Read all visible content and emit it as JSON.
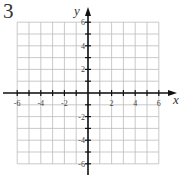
{
  "problem_number": "3",
  "graph": {
    "x_label": "x",
    "y_label": "y",
    "x_range": [
      -6,
      6
    ],
    "y_range": [
      -6,
      6
    ],
    "grid_step": 1,
    "x_tick_labels": [
      "-6",
      "-4",
      "-2",
      "2",
      "4",
      "6"
    ],
    "y_tick_labels": [
      "6",
      "4",
      "2",
      "-2",
      "-4",
      "-6"
    ],
    "grid_color": "#bbbbbb",
    "axis_color": "#111111"
  }
}
